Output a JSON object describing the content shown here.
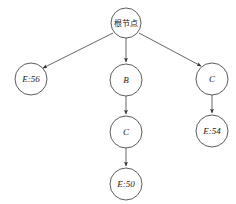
{
  "diagram": {
    "background_color": "#ffffff",
    "stroke_color": "#4a4a4a",
    "edge_color": "#555555",
    "text_color": "#1a1a1a",
    "nodes": [
      {
        "id": "root",
        "label": "根节点",
        "script": "cjk",
        "cx": 126,
        "cy": 23,
        "r": 15
      },
      {
        "id": "e56",
        "label": "E:56",
        "script": "latin",
        "cx": 31,
        "cy": 79,
        "r": 16
      },
      {
        "id": "b",
        "label": "B",
        "script": "latin",
        "cx": 126,
        "cy": 80,
        "r": 16
      },
      {
        "id": "c1",
        "label": "C",
        "script": "latin",
        "cx": 212,
        "cy": 79,
        "r": 16
      },
      {
        "id": "c2",
        "label": "C",
        "script": "latin",
        "cx": 126,
        "cy": 132,
        "r": 16
      },
      {
        "id": "e54",
        "label": "E:54",
        "script": "latin",
        "cx": 212,
        "cy": 131,
        "r": 16
      },
      {
        "id": "e50",
        "label": "E:50",
        "script": "latin",
        "cx": 126,
        "cy": 184,
        "r": 16
      }
    ],
    "edges": [
      {
        "from": "root",
        "to": "e56",
        "x1": 113,
        "y1": 33,
        "x2": 43,
        "y2": 68
      },
      {
        "from": "root",
        "to": "b",
        "x1": 126,
        "y1": 38,
        "x2": 126,
        "y2": 62
      },
      {
        "from": "root",
        "to": "c1",
        "x1": 139,
        "y1": 33,
        "x2": 201,
        "y2": 66
      },
      {
        "from": "b",
        "to": "c2",
        "x1": 126,
        "y1": 96,
        "x2": 126,
        "y2": 114
      },
      {
        "from": "c2",
        "to": "e50",
        "x1": 126,
        "y1": 148,
        "x2": 126,
        "y2": 166
      },
      {
        "from": "c1",
        "to": "e54",
        "x1": 212,
        "y1": 95,
        "x2": 212,
        "y2": 113
      }
    ]
  }
}
